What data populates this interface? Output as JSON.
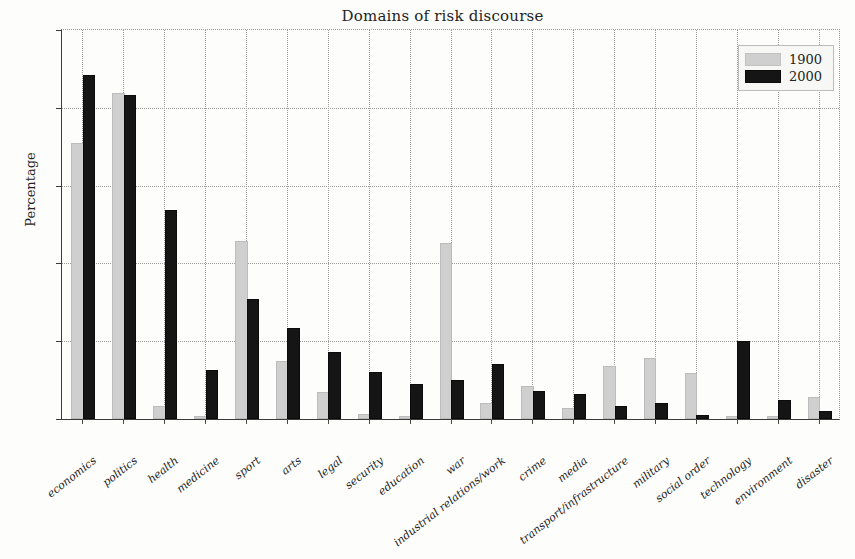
{
  "chart_data": {
    "type": "bar",
    "title": "Domains of risk discourse",
    "xlabel": "",
    "ylabel": "Percentage",
    "ylim": [
      0,
      25
    ],
    "yticks": [
      0,
      5,
      10,
      15,
      20,
      25
    ],
    "grid": true,
    "legend_position": "top-right",
    "categories": [
      "economics",
      "politics",
      "health",
      "medicine",
      "sport",
      "arts",
      "legal",
      "security",
      "education",
      "war",
      "industrial relations/work",
      "crime",
      "media",
      "transport/infrastructure",
      "military",
      "social order",
      "technology",
      "environment",
      "disaster"
    ],
    "series": [
      {
        "name": "1900",
        "color": "#cfcfcf",
        "values": [
          17.6,
          20.8,
          0.7,
          0.0,
          11.3,
          3.6,
          1.6,
          0.2,
          0.0,
          11.2,
          0.9,
          2.0,
          0.6,
          3.3,
          3.8,
          2.8,
          0.0,
          0.0,
          1.3
        ]
      },
      {
        "name": "2000",
        "color": "#151515",
        "values": [
          22.0,
          20.7,
          13.3,
          3.0,
          7.6,
          5.7,
          4.2,
          2.9,
          2.1,
          2.4,
          3.4,
          1.7,
          1.5,
          0.7,
          0.9,
          0.1,
          4.9,
          1.1,
          0.4
        ]
      }
    ]
  },
  "legend": {
    "entries": [
      {
        "label": "1900",
        "swatch": "light-gray"
      },
      {
        "label": "2000",
        "swatch": "black"
      }
    ]
  }
}
